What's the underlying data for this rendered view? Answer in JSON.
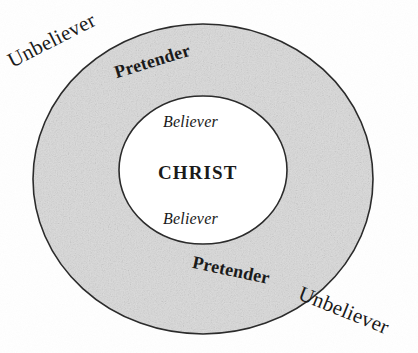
{
  "diagram": {
    "type": "concentric-circles",
    "colors": {
      "outer_ring_fill": "#d9d9d9",
      "inner_circle_fill": "#ffffff",
      "outline": "#2b2b2b",
      "text": "#1a1a1a",
      "background": "#ffffff"
    },
    "geometry": {
      "outer_circle": {
        "cx": 203,
        "cy": 179,
        "rx": 170,
        "ry": 155
      },
      "inner_circle": {
        "cx": 203,
        "cy": 170,
        "rx": 84,
        "ry": 74
      }
    },
    "regions": [
      {
        "name": "outside",
        "label": "Unbeliever"
      },
      {
        "name": "outer-ring",
        "label": "Pretender"
      },
      {
        "name": "inner-circle",
        "label": "Believer"
      },
      {
        "name": "center",
        "label": "CHRIST"
      }
    ]
  },
  "labels": {
    "unbeliever_top": "Unbeliever",
    "pretender_top": "Pretender",
    "believer_top": "Believer",
    "christ": "CHRIST",
    "believer_bottom": "Believer",
    "pretender_bottom": "Pretender",
    "unbeliever_bottom": "Unbeliever"
  }
}
